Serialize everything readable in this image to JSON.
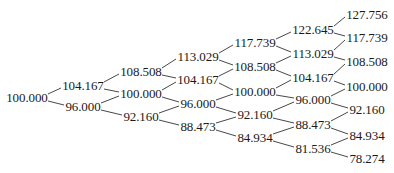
{
  "diagram": {
    "type": "binomial-tree",
    "levels": [
      {
        "x": 27,
        "nodes": [
          {
            "label": "100.000",
            "y": 98
          }
        ]
      },
      {
        "x": 83,
        "nodes": [
          {
            "label": "104.167",
            "y": 86
          },
          {
            "label": "96.000",
            "y": 107
          }
        ]
      },
      {
        "x": 141,
        "nodes": [
          {
            "label": "108.508",
            "y": 72
          },
          {
            "label": "100.000",
            "y": 94
          },
          {
            "label": "92.160",
            "y": 117
          }
        ]
      },
      {
        "x": 198,
        "nodes": [
          {
            "label": "113.029",
            "y": 57
          },
          {
            "label": "104.167",
            "y": 80
          },
          {
            "label": "96.000",
            "y": 104
          },
          {
            "label": "88.473",
            "y": 127
          }
        ]
      },
      {
        "x": 255,
        "nodes": [
          {
            "label": "117.739",
            "y": 43
          },
          {
            "label": "108.508",
            "y": 67
          },
          {
            "label": "100.000",
            "y": 92
          },
          {
            "label": "92.160",
            "y": 115
          },
          {
            "label": "84.934",
            "y": 138
          }
        ]
      },
      {
        "x": 313,
        "nodes": [
          {
            "label": "122.645",
            "y": 30
          },
          {
            "label": "113.029",
            "y": 54
          },
          {
            "label": "104.167",
            "y": 78
          },
          {
            "label": "96.000",
            "y": 100
          },
          {
            "label": "88.473",
            "y": 125
          },
          {
            "label": "81.536",
            "y": 149
          }
        ]
      },
      {
        "x": 367,
        "nodes": [
          {
            "label": "127.756",
            "y": 15
          },
          {
            "label": "117.739",
            "y": 38
          },
          {
            "label": "108.508",
            "y": 62
          },
          {
            "label": "100.000",
            "y": 87
          },
          {
            "label": "92.160",
            "y": 110
          },
          {
            "label": "84.934",
            "y": 136
          },
          {
            "label": "78.274",
            "y": 159
          }
        ]
      }
    ],
    "edge_color": "#333333",
    "text_color": "#1a1a1a"
  }
}
